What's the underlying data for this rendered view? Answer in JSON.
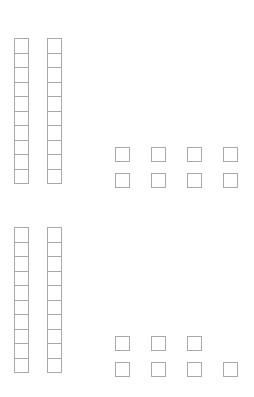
{
  "page": {
    "background_color": "#ffffff",
    "block_outline_color": "#a9a9a9",
    "block_fill_color": "#ffffff"
  },
  "chart_data": {
    "type": "table",
    "xlabel": "",
    "ylabel": "",
    "categories": [
      "Group 1",
      "Group 2"
    ],
    "values": [
      28,
      27
    ],
    "series": [
      {
        "name": "Rods (tens)",
        "values": [
          2,
          2
        ]
      },
      {
        "name": "Units (ones)",
        "values": [
          8,
          7
        ]
      }
    ]
  },
  "groups": [
    {
      "name": "group-top",
      "rod_count": 2,
      "rod_cell_count": 10,
      "tens_value": 20,
      "unit_count": 8,
      "ones_value": 8,
      "total": 28,
      "unit_rows": [
        4,
        4
      ]
    },
    {
      "name": "group-bottom",
      "rod_count": 2,
      "rod_cell_count": 10,
      "tens_value": 20,
      "unit_count": 7,
      "ones_value": 7,
      "total": 27,
      "unit_rows": [
        3,
        4
      ]
    }
  ]
}
